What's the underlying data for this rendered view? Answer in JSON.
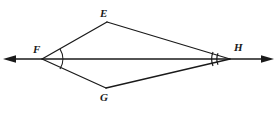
{
  "figure": {
    "background_color": "#ffffff",
    "stroke_color": "#1a1a1a",
    "canvas": {
      "width": 277,
      "height": 113
    },
    "vertices": [
      {
        "id": "E",
        "label": "E",
        "x": 107,
        "y": 22,
        "label_x": 100,
        "label_y": 8
      },
      {
        "id": "F",
        "label": "F",
        "x": 42,
        "y": 59,
        "label_x": 33,
        "label_y": 44
      },
      {
        "id": "G",
        "label": "G",
        "x": 106,
        "y": 88,
        "label_x": 100,
        "label_y": 92
      },
      {
        "id": "H",
        "label": "H",
        "x": 230,
        "y": 59,
        "label_x": 234,
        "label_y": 42
      }
    ],
    "segments": [
      {
        "name": "segment-FE",
        "from": "F",
        "to": "E"
      },
      {
        "name": "segment-EH",
        "from": "E",
        "to": "H"
      },
      {
        "name": "segment-FG",
        "from": "F",
        "to": "G"
      },
      {
        "name": "segment-GH",
        "from": "G",
        "to": "H"
      },
      {
        "name": "segment-FH-diagonal",
        "from": "F",
        "to": "H"
      }
    ],
    "line": {
      "name": "line-FH",
      "description": "double-headed arrow line through F and H",
      "x1": 6,
      "x2": 271,
      "y": 59,
      "arrow_left": true,
      "arrow_right": true
    },
    "angle_marks": [
      {
        "name": "angle-mark-F",
        "vertex": "F",
        "arcs": 1
      },
      {
        "name": "angle-mark-H",
        "vertex": "H",
        "arcs": 2
      }
    ]
  }
}
